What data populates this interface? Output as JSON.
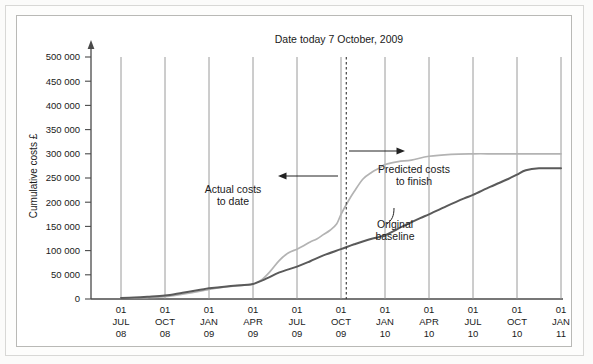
{
  "chart_data": {
    "type": "line",
    "title": "Date today 7 October, 2009",
    "xlabel": "",
    "ylabel": "Cumulative costs £",
    "ylim": [
      0,
      500000
    ],
    "ytick_labels": [
      "0",
      "50 000",
      "100 000",
      "150 000",
      "200 000",
      "250 000",
      "300 000",
      "350 000",
      "400 000",
      "450 000",
      "500 000"
    ],
    "ytick_values": [
      0,
      50000,
      100000,
      150000,
      200000,
      250000,
      300000,
      350000,
      400000,
      450000,
      500000
    ],
    "grid": "vertical",
    "legend": "none",
    "categories": [
      {
        "day": "01",
        "month": "JUL",
        "year": "08"
      },
      {
        "day": "01",
        "month": "OCT",
        "year": "08"
      },
      {
        "day": "01",
        "month": "JAN",
        "year": "09"
      },
      {
        "day": "01",
        "month": "APR",
        "year": "09"
      },
      {
        "day": "01",
        "month": "JUL",
        "year": "09"
      },
      {
        "day": "01",
        "month": "OCT",
        "year": "09"
      },
      {
        "day": "01",
        "month": "JAN",
        "year": "10"
      },
      {
        "day": "01",
        "month": "APR",
        "year": "10"
      },
      {
        "day": "01",
        "month": "JUL",
        "year": "10"
      },
      {
        "day": "01",
        "month": "OCT",
        "year": "10"
      },
      {
        "day": "01",
        "month": "JAN",
        "year": "11"
      }
    ],
    "series": [
      {
        "name": "Actual costs to date / Predicted costs to finish",
        "color": "#b3b3b3",
        "x": [
          0.0,
          0.3,
          0.6,
          1.0,
          1.4,
          1.8,
          2.0,
          2.3,
          2.6,
          2.85,
          3.0,
          3.2,
          3.4,
          3.6,
          3.8,
          4.0,
          4.15,
          4.3,
          4.45,
          4.6,
          4.75,
          4.9,
          5.0,
          5.15,
          5.3,
          5.5,
          5.7,
          5.9,
          6.0,
          6.3,
          6.6,
          7.0,
          7.5,
          8.0,
          8.5,
          9.0,
          9.5,
          10.0
        ],
        "values": [
          2000,
          2500,
          3000,
          5000,
          10000,
          16000,
          20000,
          24000,
          27000,
          29000,
          31000,
          40000,
          58000,
          80000,
          95000,
          103000,
          110000,
          118000,
          124000,
          133000,
          142000,
          155000,
          175000,
          200000,
          222000,
          248000,
          262000,
          272000,
          278000,
          284000,
          287000,
          295000,
          299000,
          300000,
          300000,
          300000,
          300000,
          300000
        ]
      },
      {
        "name": "Original baseline",
        "color": "#5a5a5a",
        "x": [
          0.0,
          0.3,
          0.6,
          1.0,
          1.4,
          1.8,
          2.0,
          2.4,
          2.8,
          3.0,
          3.3,
          3.6,
          4.0,
          4.3,
          4.6,
          5.0,
          5.3,
          5.6,
          6.0,
          6.4,
          6.8,
          7.0,
          7.4,
          7.8,
          8.0,
          8.4,
          8.8,
          9.0,
          9.2,
          9.5,
          10.0
        ],
        "values": [
          2000,
          3000,
          4500,
          7000,
          13000,
          19000,
          22000,
          26000,
          29000,
          31000,
          42000,
          55000,
          67000,
          78000,
          90000,
          103000,
          113000,
          122000,
          132000,
          150000,
          167000,
          175000,
          192000,
          208000,
          215000,
          232000,
          248000,
          257000,
          266000,
          270000,
          270000
        ]
      }
    ],
    "annotations": [
      {
        "name": "actual-costs-label",
        "line1": "Actual costs",
        "line2": "to date"
      },
      {
        "name": "predicted-costs-label",
        "line1": "Predicted costs",
        "line2": "to finish"
      },
      {
        "name": "original-baseline-label",
        "line1": "Original",
        "line2": "baseline"
      }
    ],
    "today_marker": {
      "label": "Date today 7 October, 2009",
      "x": 5.12
    }
  }
}
